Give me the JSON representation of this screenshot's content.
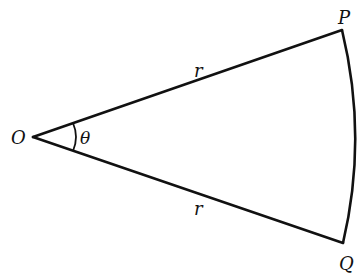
{
  "diagram": {
    "type": "circular-sector",
    "labels": {
      "center": "O",
      "point_top": "P",
      "point_bottom": "Q",
      "radius_top": "r",
      "radius_bottom": "r",
      "angle": "θ"
    },
    "points": {
      "O": [
        33,
        137
      ],
      "P": [
        342,
        30
      ],
      "Q": [
        343,
        243
      ]
    },
    "stroke_color": "#111111",
    "background": "#ffffff"
  }
}
